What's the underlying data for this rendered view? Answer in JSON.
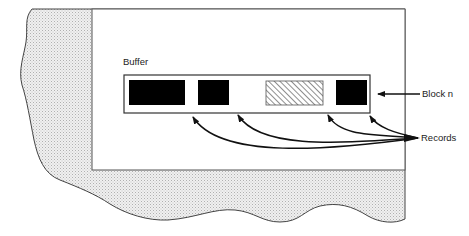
{
  "diagram": {
    "type": "memory buffer illustration",
    "labels": {
      "buffer": "Buffer",
      "block": "Block n",
      "records": "Records"
    },
    "buffer": {
      "records": [
        {
          "id": 1,
          "style": "filled",
          "color": "#000000"
        },
        {
          "id": 2,
          "style": "filled",
          "color": "#000000"
        },
        {
          "id": 3,
          "style": "hatched",
          "color": "#555555"
        },
        {
          "id": 4,
          "style": "filled",
          "color": "#000000"
        }
      ]
    },
    "colors": {
      "line": "#333333",
      "stipple_bg": "#eeeeee",
      "stipple_dot": "#b5b5b5",
      "fill": "#000000",
      "white": "#ffffff"
    }
  }
}
